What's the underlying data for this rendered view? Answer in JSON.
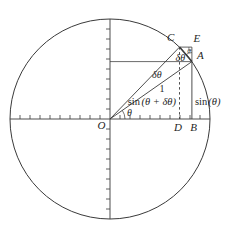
{
  "diagram": {
    "background_color": "#ffffff",
    "line_color": "#3a3a3a",
    "point_labels": {
      "O": "O",
      "A": "A",
      "B": "B",
      "C": "C",
      "D": "D",
      "E": "E"
    },
    "angle_labels": {
      "theta_at_origin": "θ",
      "delta_theta_between_radii": "δθ",
      "delta_theta_chord": "δθ",
      "theta_at_A": "θ"
    },
    "length_labels": {
      "radius_one": "1",
      "sin_function": "sin",
      "sin_theta_argument": "(θ)",
      "sin_theta_plus_delta_argument": "(θ + δθ)"
    }
  }
}
